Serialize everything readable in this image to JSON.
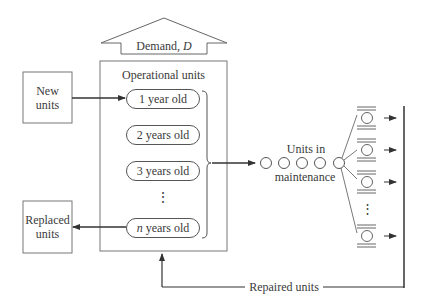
{
  "demand_arrow": {
    "label_prefix": "Demand, ",
    "label_var": "D"
  },
  "operational": {
    "title": "Operational units",
    "ages": [
      {
        "label": "1 year old"
      },
      {
        "label": "2 years old"
      },
      {
        "label": "3 years old"
      },
      {
        "label_var": "n",
        "label": " years old"
      }
    ],
    "ellipsis": "⋮"
  },
  "new_units": {
    "line1": "New",
    "line2": "units"
  },
  "replaced_units": {
    "line1": "Replaced",
    "line2": "units"
  },
  "maintenance": {
    "label_top": "Units in",
    "label_bottom": "maintenance",
    "queue_count": 5,
    "servers_visible": 4,
    "ellipsis": "⋮"
  },
  "repaired": {
    "label": "Repaired units"
  },
  "colors": {
    "line": "#3a3a3a",
    "box_border": "#777777",
    "background": "#ffffff"
  }
}
